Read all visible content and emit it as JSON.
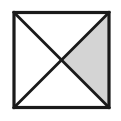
{
  "figure": {
    "canvas": {
      "width": 121,
      "height": 121,
      "background": "#ffffff"
    },
    "shape": {
      "type": "square",
      "name": "square-outline",
      "x": 14,
      "y": 12.5,
      "size": 95,
      "stroke_color": "#1a1a1a",
      "stroke_width": 3.2,
      "fill_color": "#ffffff"
    },
    "diagonals": [
      {
        "name": "diagonal-top-left-to-bottom-right",
        "x1": 14,
        "y1": 12.5,
        "x2": 109,
        "y2": 107.5,
        "stroke_color": "#1a1a1a",
        "stroke_width": 2.8
      },
      {
        "name": "diagonal-top-right-to-bottom-left",
        "x1": 109,
        "y1": 12.5,
        "x2": 14,
        "y2": 107.5,
        "stroke_color": "#1a1a1a",
        "stroke_width": 2.8
      }
    ],
    "center_point": {
      "x": 61.5,
      "y": 60
    },
    "regions": [
      {
        "name": "triangle-top",
        "label": "top",
        "shaded": "false",
        "fill_color": "#ffffff",
        "points": "14,12.5 109,12.5 61.5,60"
      },
      {
        "name": "triangle-right",
        "label": "right",
        "shaded": "true",
        "fill_color": "#d4d4d4",
        "points": "109,12.5 109,107.5 61.5,60"
      },
      {
        "name": "triangle-bottom",
        "label": "bottom",
        "shaded": "false",
        "fill_color": "#ffffff",
        "points": "14,107.5 109,107.5 61.5,60"
      },
      {
        "name": "triangle-left",
        "label": "left",
        "shaded": "false",
        "fill_color": "#ffffff",
        "points": "14,12.5 14,107.5 61.5,60"
      }
    ],
    "shaded_fraction": "1/4"
  }
}
